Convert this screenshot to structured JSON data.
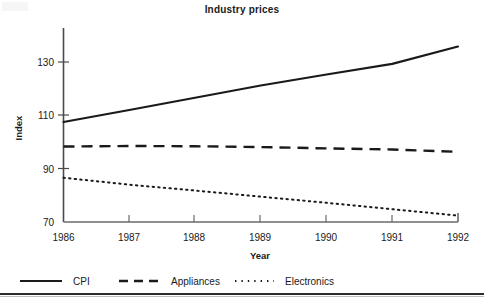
{
  "chart_data": {
    "type": "line",
    "title": "Industry prices",
    "xlabel": "Year",
    "ylabel": "Index",
    "x": [
      1986,
      1987,
      1988,
      1989,
      1990,
      1991,
      1992
    ],
    "xticklabels": [
      "1986",
      "1987",
      "1988",
      "1989",
      "1990",
      "1991",
      "1992"
    ],
    "yticklabels": [
      "70",
      "90",
      "110",
      "130"
    ],
    "yticks": [
      70,
      90,
      110,
      130
    ],
    "ylim": [
      70,
      140
    ],
    "xlim": [
      1986,
      1992
    ],
    "grid": false,
    "legend_position": "below-bottom-left",
    "series": [
      {
        "name": "CPI",
        "style": "solid",
        "color": "#1a1a1a",
        "values": [
          107.5,
          112.0,
          116.6,
          121.2,
          125.3,
          129.3,
          135.8
        ]
      },
      {
        "name": "Appliances",
        "style": "dashed",
        "color": "#1a1a1a",
        "values": [
          98.3,
          98.5,
          98.4,
          98.1,
          97.6,
          97.2,
          96.3
        ]
      },
      {
        "name": "Electronics",
        "style": "dotted",
        "color": "#1a1a1a",
        "values": [
          86.6,
          84.0,
          81.8,
          79.5,
          77.2,
          74.8,
          72.4
        ]
      }
    ]
  },
  "axes": {
    "title": "Industry prices",
    "y_axis_title": "Index",
    "x_axis_title": "Year",
    "y_ticks": [
      {
        "label": "130",
        "value": 130
      },
      {
        "label": "110",
        "value": 110
      },
      {
        "label": "90",
        "value": 90
      },
      {
        "label": "70",
        "value": 70
      }
    ],
    "x_ticks": [
      {
        "label": "1986",
        "value": 1986
      },
      {
        "label": "1987",
        "value": 1987
      },
      {
        "label": "1988",
        "value": 1988
      },
      {
        "label": "1989",
        "value": 1989
      },
      {
        "label": "1990",
        "value": 1990
      },
      {
        "label": "1991",
        "value": 1991
      },
      {
        "label": "1992",
        "value": 1992
      }
    ]
  },
  "legend": {
    "entries": [
      {
        "label": "CPI",
        "style": "solid"
      },
      {
        "label": "Appliances",
        "style": "dashed"
      },
      {
        "label": "Electronics",
        "style": "dotted"
      }
    ]
  },
  "colors": {
    "ink": "#1a1a1a",
    "axis": "#4a4a4a",
    "background": "#ffffff",
    "rule": "#2b2b2b"
  }
}
